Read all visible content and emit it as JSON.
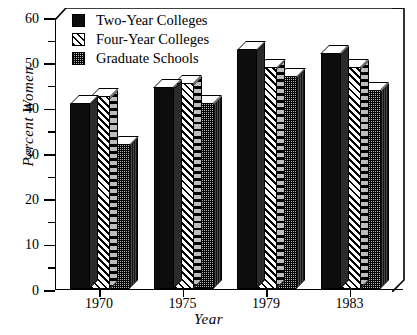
{
  "chart_data": {
    "type": "bar",
    "title": "",
    "xlabel": "Year",
    "ylabel": "Percent  Women",
    "categories": [
      "1970",
      "1975",
      "1979",
      "1983"
    ],
    "series": [
      {
        "name": "Two-Year Colleges",
        "pattern": "solid-black",
        "values": [
          41.0,
          44.5,
          53.0,
          52.0
        ]
      },
      {
        "name": "Four-Year Colleges",
        "pattern": "diagonal-hatch",
        "values": [
          42.5,
          45.5,
          49.0,
          49.0
        ]
      },
      {
        "name": "Graduate Schools",
        "pattern": "stipple-gray",
        "values": [
          32.0,
          41.0,
          47.0,
          44.0
        ]
      }
    ],
    "ylim": [
      0,
      60
    ],
    "ymajor_ticks": [
      0,
      10,
      20,
      30,
      40,
      50,
      60
    ],
    "yminor_ticks": [
      5,
      15,
      25,
      35,
      45,
      55
    ],
    "ytick_labels": [
      "0",
      "10",
      "20",
      "30",
      "40",
      "50",
      "60"
    ],
    "grid": false,
    "legend_position": "top-left",
    "style": "3d-bars"
  },
  "axes": {
    "y_label": "Percent  Women",
    "x_label": "Year"
  },
  "legend": {
    "items": [
      {
        "label": "Two-Year Colleges"
      },
      {
        "label": "Four-Year Colleges"
      },
      {
        "label": "Graduate Schools"
      }
    ]
  },
  "colors": {
    "foreground": "#000000",
    "background": "#ffffff",
    "series_solid": "#0d0d0d",
    "series_hatch": "#ffffff",
    "series_stipple": "#b9b9b9"
  }
}
